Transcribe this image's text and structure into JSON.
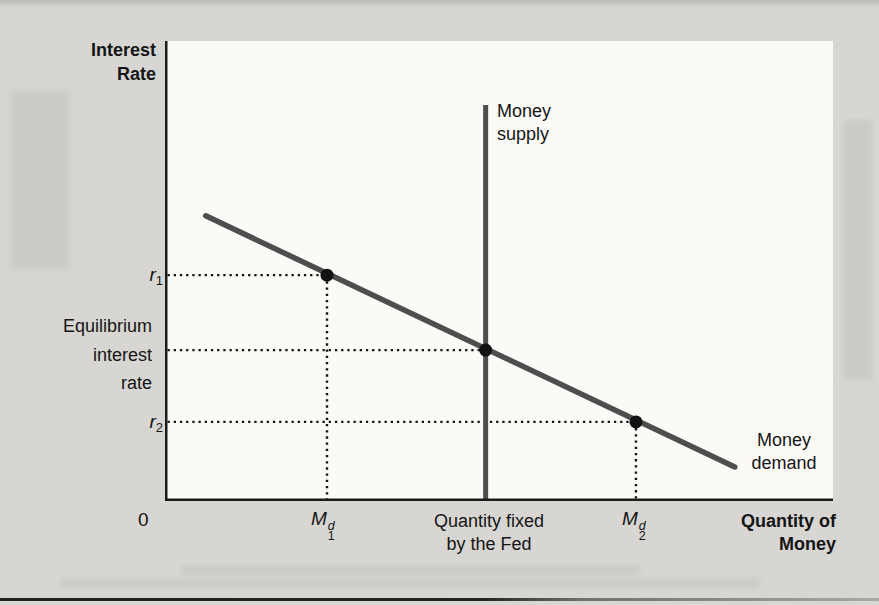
{
  "page": {
    "background_color": "#d7d6d3",
    "plot_background_color": "#fbfaf7",
    "bottom_rule_color": "#202020"
  },
  "labels": {
    "y_title": [
      "Interest",
      "Rate"
    ],
    "x_title": [
      "Quantity of",
      "Money"
    ],
    "supply": [
      "Money",
      "supply"
    ],
    "demand": [
      "Money",
      "demand"
    ],
    "equilibrium": [
      "Equilibrium",
      "interest",
      "rate"
    ],
    "r1_base": "r",
    "r1_sub": "1",
    "r2_base": "r",
    "r2_sub": "2",
    "m1_base": "M",
    "m1_sup": "d",
    "m1_sub": "1",
    "m2_base": "M",
    "m2_sup": "d",
    "m2_sub": "2",
    "origin": "0",
    "qty_fixed": [
      "Quantity fixed",
      "by the Fed"
    ]
  },
  "chart_data": {
    "type": "line",
    "title": "",
    "xlabel": "Quantity of Money",
    "ylabel": "Interest Rate",
    "x_numeric": false,
    "y_numeric": false,
    "axis_tick_labels_x": [
      "0",
      "M1^d",
      "Quantity fixed by the Fed",
      "M2^d"
    ],
    "axis_tick_labels_y": [
      "r1",
      "Equilibrium interest rate",
      "r2"
    ],
    "colors": {
      "curve": "#4e4e4e",
      "axis": "#1b1b1b",
      "marker": "#121212",
      "guide": "#141414"
    },
    "series": [
      {
        "name": "Money supply",
        "shape": "vertical-line",
        "x": 0.48,
        "y_from": 0.0,
        "y_to": 0.861,
        "width": 5
      },
      {
        "name": "Money demand",
        "shape": "line-segment",
        "points": [
          [
            0.061,
            0.62
          ],
          [
            0.853,
            0.074
          ]
        ],
        "width": 5.5
      }
    ],
    "markers": [
      {
        "name": "r1",
        "x": 0.2425,
        "y": 0.491,
        "x_label": "M1^d",
        "y_label": "r1"
      },
      {
        "name": "equilibrium",
        "x": 0.48,
        "y": 0.328,
        "x_label": "Quantity fixed by the Fed",
        "y_label": "Equilibrium interest rate"
      },
      {
        "name": "r2",
        "x": 0.705,
        "y": 0.172,
        "x_label": "M2^d",
        "y_label": "r2"
      }
    ],
    "marker_radius": 6.5,
    "guides": "dotted-to-both-axes",
    "legend": "none"
  }
}
